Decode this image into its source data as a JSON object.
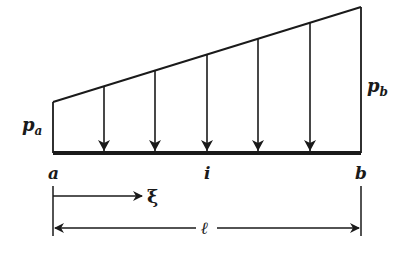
{
  "diagram": {
    "labels": {
      "load_left": "p",
      "load_left_sub": "a",
      "load_right": "p",
      "load_right_sub": "b",
      "node_left": "a",
      "node_mid": "i",
      "node_right": "b",
      "coordinate": "ξ",
      "length": "ℓ"
    },
    "load_arrow_count": 5,
    "colors": {
      "line": "#1a1a1a",
      "background": "#ffffff"
    }
  }
}
